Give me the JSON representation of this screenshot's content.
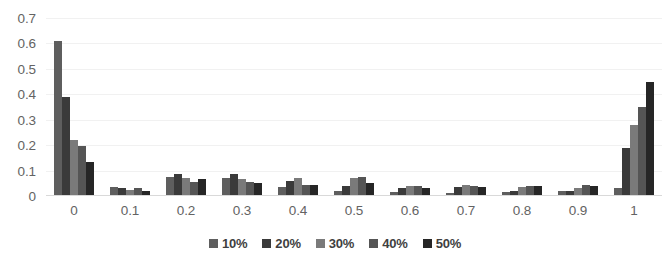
{
  "chart_data": {
    "type": "bar",
    "title": "",
    "subtitle": "",
    "xlabel": "",
    "ylabel": "",
    "categories": [
      "0",
      "0.1",
      "0.2",
      "0.3",
      "0.4",
      "0.5",
      "0.6",
      "0.7",
      "0.8",
      "0.9",
      "1"
    ],
    "ylim": [
      0,
      0.7
    ],
    "ytick_labels": [
      "0.7",
      "0.6",
      "0.5",
      "0.4",
      "0.3",
      "0.2",
      "0.1",
      "0"
    ],
    "ytick_values": [
      0.7,
      0.6,
      0.5,
      0.4,
      0.3,
      0.2,
      0.1,
      0
    ],
    "grid": true,
    "grid_axis": "y",
    "legend_position": "bottom",
    "series": [
      {
        "name": "10%",
        "color": "#5e5e5e",
        "values": [
          0.61,
          0.035,
          0.075,
          0.07,
          0.035,
          0.02,
          0.015,
          0.01,
          0.015,
          0.02,
          0.03
        ]
      },
      {
        "name": "20%",
        "color": "#3a3a3a",
        "values": [
          0.39,
          0.03,
          0.085,
          0.085,
          0.06,
          0.04,
          0.03,
          0.035,
          0.02,
          0.02,
          0.19
        ]
      },
      {
        "name": "30%",
        "color": "#7a7a7a",
        "values": [
          0.22,
          0.025,
          0.07,
          0.065,
          0.07,
          0.07,
          0.04,
          0.045,
          0.035,
          0.03,
          0.28
        ]
      },
      {
        "name": "40%",
        "color": "#555555",
        "values": [
          0.195,
          0.03,
          0.055,
          0.055,
          0.045,
          0.075,
          0.04,
          0.04,
          0.04,
          0.045,
          0.35
        ]
      },
      {
        "name": "50%",
        "color": "#262626",
        "values": [
          0.135,
          0.02,
          0.065,
          0.05,
          0.045,
          0.05,
          0.03,
          0.035,
          0.04,
          0.04,
          0.45
        ]
      }
    ]
  }
}
